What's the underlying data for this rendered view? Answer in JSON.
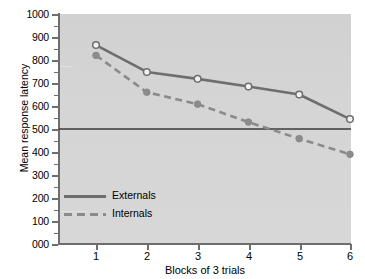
{
  "chart_data": {
    "type": "line",
    "title": "",
    "xlabel": "Blocks of 3 trials",
    "ylabel": "Mean response latency",
    "x": [
      1,
      2,
      3,
      4,
      5,
      6
    ],
    "xtick_labels": [
      "1",
      "2",
      "3",
      "4",
      "5",
      "6"
    ],
    "ytick_labels": [
      "000",
      "100",
      "200",
      "300",
      "400",
      "500",
      "600",
      "700",
      "800",
      "900",
      "1000"
    ],
    "ytick_values": [
      0,
      100,
      200,
      300,
      400,
      500,
      600,
      700,
      800,
      900,
      1000
    ],
    "ylim": [
      0,
      1000
    ],
    "xlim": [
      0.55,
      6.45
    ],
    "grid": false,
    "legend_position": "inner-lower-left",
    "series": [
      {
        "name": "Externals",
        "values": [
          865,
          748,
          718,
          685,
          650,
          543
        ],
        "marker": "open-circle",
        "linestyle": "solid",
        "color": "#6e6e6e"
      },
      {
        "name": "Internals",
        "values": [
          820,
          660,
          608,
          530,
          458,
          390
        ],
        "marker": "filled-circle",
        "linestyle": "dashed",
        "color": "#8b8b8b"
      }
    ],
    "reference_line": {
      "value": 500,
      "orientation": "horizontal",
      "color": "#3a3a3a",
      "label": ""
    },
    "plot_background": "#d5d5d5",
    "axis_color": "#6e6e6e"
  },
  "legend": {
    "items": [
      {
        "label": "Externals",
        "style": "solid"
      },
      {
        "label": "Internals",
        "style": "dashed"
      }
    ]
  }
}
